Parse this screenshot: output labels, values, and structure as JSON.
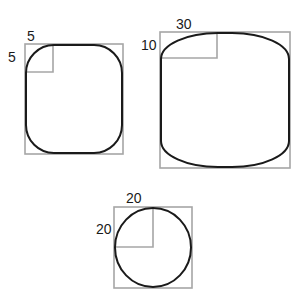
{
  "figure": {
    "background_color": "#ffffff",
    "outline_color": "#1a1a1a",
    "guide_color": "#a6a6a6",
    "shapes": [
      {
        "id": "shape-small-rounded-square",
        "bbox": {
          "x": 25,
          "y": 44,
          "width": 98,
          "height": 110
        },
        "corner_radius_x": 5,
        "corner_radius_y": 5,
        "radius_box_px": {
          "width": 28,
          "height": 28
        },
        "labels": {
          "top": "5",
          "left": "5"
        },
        "label_positions": {
          "top": {
            "x": 27,
            "y": 29
          },
          "left": {
            "x": 8,
            "y": 50
          }
        }
      },
      {
        "id": "shape-wide-rounded-rect",
        "bbox": {
          "x": 160,
          "y": 32,
          "width": 130,
          "height": 136
        },
        "corner_radius_x": 30,
        "corner_radius_y": 10,
        "radius_box_px": {
          "width": 57,
          "height": 26
        },
        "labels": {
          "top": "30",
          "left": "10"
        },
        "label_positions": {
          "top": {
            "x": 176,
            "y": 17
          },
          "left": {
            "x": 141,
            "y": 38
          }
        }
      },
      {
        "id": "shape-circle",
        "bbox": {
          "x": 114,
          "y": 207,
          "width": 78,
          "height": 81
        },
        "corner_radius_x": 20,
        "corner_radius_y": 20,
        "radius_box_px": {
          "width": 39,
          "height": 40
        },
        "labels": {
          "top": "20",
          "left": "20"
        },
        "label_positions": {
          "top": {
            "x": 126,
            "y": 191
          },
          "left": {
            "x": 96,
            "y": 222
          }
        }
      }
    ]
  }
}
